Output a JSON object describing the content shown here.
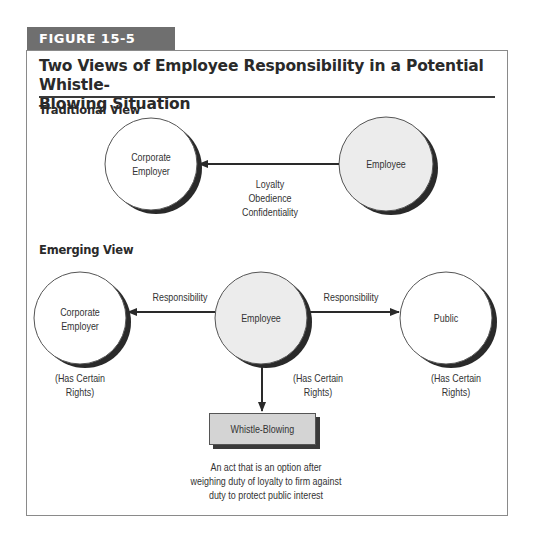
{
  "figure": {
    "label": "FIGURE 15-5",
    "title_line1": "Two Views of Employee Responsibility in a Potential Whistle-",
    "title_line2": "Blowing Situation",
    "colors": {
      "tab": "#6f6f6f",
      "frame": "#8a8a8a",
      "employee_fill": "#ececec",
      "box_fill": "#d4d4d4",
      "shadow": "#333333"
    }
  },
  "traditional": {
    "heading": "Traditional View",
    "nodes": {
      "employer": {
        "line1": "Corporate",
        "line2": "Employer"
      },
      "employee": {
        "label": "Employee"
      }
    },
    "edge": {
      "from": "Employee",
      "to": "Corporate Employer",
      "labels": [
        "Loyalty",
        "Obedience",
        "Confidentiality"
      ]
    }
  },
  "emerging": {
    "heading": "Emerging View",
    "nodes": {
      "employer": {
        "line1": "Corporate",
        "line2": "Employer",
        "note1": "(Has Certain",
        "note2": "Rights)"
      },
      "employee": {
        "label": "Employee",
        "note1": "(Has Certain",
        "note2": "Rights)"
      },
      "public": {
        "label": "Public",
        "note1": "(Has Certain",
        "note2": "Rights)"
      }
    },
    "edges": [
      {
        "from": "Employee",
        "to": "Corporate Employer",
        "label": "Responsibility"
      },
      {
        "from": "Employee",
        "to": "Public",
        "label": "Responsibility"
      },
      {
        "from": "Employee",
        "to": "Whistle-Blowing",
        "label": ""
      }
    ],
    "whistleblowing": {
      "label": "Whistle-Blowing",
      "caption1": "An act that is an option after",
      "caption2": "weighing duty of loyalty to firm against",
      "caption3": "duty to protect public interest"
    }
  }
}
